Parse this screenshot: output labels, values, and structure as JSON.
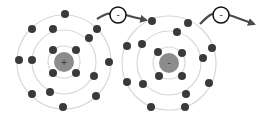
{
  "diagram": {
    "colors": {
      "shell": "#d8d8d8",
      "electron": "#3a3a3a",
      "nucleus": "#8c8c8c",
      "arrow": "#4a4a4a",
      "ion_circle": "#111111"
    },
    "atoms": [
      {
        "name": "atom-1",
        "nucleus_symbol": "+",
        "center": [
          64,
          62
        ],
        "nucleus_radius": 10,
        "shells": [
          16,
          32,
          47
        ],
        "electrons": [
          [
            65,
            14
          ],
          [
            32,
            29
          ],
          [
            53,
            29
          ],
          [
            97,
            29
          ],
          [
            89,
            38
          ],
          [
            53,
            50
          ],
          [
            76,
            50
          ],
          [
            19,
            60
          ],
          [
            32,
            60
          ],
          [
            109,
            62
          ],
          [
            53,
            73
          ],
          [
            76,
            73
          ],
          [
            94,
            76
          ],
          [
            32,
            94
          ],
          [
            50,
            92
          ],
          [
            96,
            96
          ],
          [
            63,
            107
          ]
        ]
      },
      {
        "name": "atom-2",
        "nucleus_symbol": "-",
        "center": [
          169,
          63
        ],
        "nucleus_radius": 10,
        "shells": [
          16,
          32,
          47
        ],
        "electrons": [
          [
            152,
            21
          ],
          [
            188,
            23
          ],
          [
            177,
            32
          ],
          [
            127,
            46
          ],
          [
            142,
            44
          ],
          [
            212,
            48
          ],
          [
            158,
            52
          ],
          [
            182,
            53
          ],
          [
            203,
            58
          ],
          [
            159,
            76
          ],
          [
            182,
            76
          ],
          [
            127,
            82
          ],
          [
            143,
            84
          ],
          [
            209,
            83
          ],
          [
            186,
            94
          ],
          [
            151,
            107
          ],
          [
            185,
            107
          ]
        ]
      }
    ],
    "free_electrons": [
      {
        "name": "free-electron-1",
        "symbol": "-",
        "center": [
          118,
          15
        ],
        "arrow_start": [
          97,
          19
        ],
        "arrow_end": [
          146,
          20
        ]
      },
      {
        "name": "free-electron-2",
        "symbol": "-",
        "center": [
          221,
          15
        ],
        "arrow_start": [
          200,
          24
        ],
        "arrow_end": [
          254,
          24
        ]
      }
    ]
  }
}
